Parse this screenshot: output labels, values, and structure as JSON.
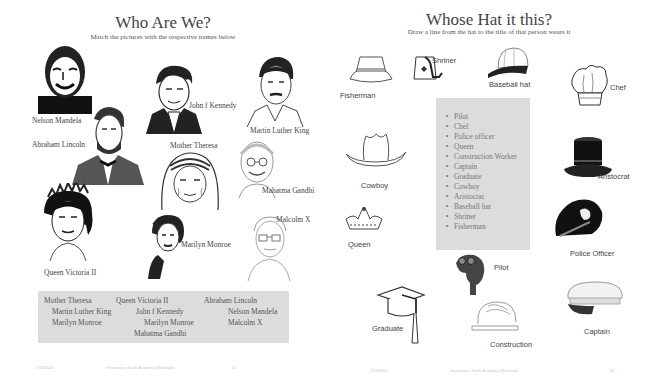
{
  "left_page": {
    "title": "Who Are We?",
    "subtitle": "Match the pictures with the respective names below",
    "portraits": [
      {
        "id": "mandela",
        "label": "Nelson Mandela",
        "icon": "portrait-mandela-icon"
      },
      {
        "id": "jfk",
        "label": "John f Kennedy",
        "icon": "portrait-jfk-icon"
      },
      {
        "id": "mlk",
        "label": "Martin Luther King",
        "icon": "portrait-mlk-icon"
      },
      {
        "id": "lincoln",
        "label": "Abraham Lincoln",
        "icon": "portrait-lincoln-icon"
      },
      {
        "id": "theresa",
        "label": "Mother Theresa",
        "icon": "portrait-theresa-icon"
      },
      {
        "id": "gandhi",
        "label": "Mahatma Gandhi",
        "icon": "portrait-gandhi-icon"
      },
      {
        "id": "queen",
        "label": "Queen Victoria II",
        "icon": "portrait-queen-icon"
      },
      {
        "id": "monroe",
        "label": "Marilyn Monroe",
        "icon": "portrait-monroe-icon"
      },
      {
        "id": "malcolm",
        "label": "Malcolm X",
        "icon": "portrait-malcolm-icon"
      }
    ],
    "names_box": {
      "rows": [
        [
          "Mother Theresa",
          "Queen Victoria II",
          "Abraham Lincoln"
        ],
        [
          "Martin Luther King",
          "John f Kennedy",
          "Nelson Mandela"
        ],
        [
          "Marilyn Monroe",
          "Marilyn Monroe",
          "Malcolm X"
        ],
        [
          "Mahatma Gandhi"
        ]
      ]
    },
    "footer": {
      "date": "7/14/2020",
      "center": "Innovations Youth Academy Workbook",
      "page": "41"
    }
  },
  "right_page": {
    "title": "Whose Hat it this?",
    "subtitle": "Draw a line from the hat to the title of that person wears it",
    "hats": [
      {
        "id": "fisherman",
        "label": "Fisherman",
        "icon": "bucket-hat-icon"
      },
      {
        "id": "shriner",
        "label": "Shriner",
        "icon": "fez-icon"
      },
      {
        "id": "baseball",
        "label": "Baseball hat",
        "icon": "baseball-cap-icon"
      },
      {
        "id": "chef",
        "label": "Chef",
        "icon": "chef-hat-icon"
      },
      {
        "id": "cowboy",
        "label": "Cowboy",
        "icon": "cowboy-hat-icon"
      },
      {
        "id": "aristocrat",
        "label": "Aristocrat",
        "icon": "top-hat-icon"
      },
      {
        "id": "queen",
        "label": "Queen",
        "icon": "crown-icon"
      },
      {
        "id": "police",
        "label": "Police Officer",
        "icon": "police-cap-icon"
      },
      {
        "id": "pilot",
        "label": "Pilot",
        "icon": "pilot-helmet-icon"
      },
      {
        "id": "graduate",
        "label": "Graduate",
        "icon": "graduation-cap-icon"
      },
      {
        "id": "construction",
        "label": "Construction",
        "icon": "hard-hat-icon"
      },
      {
        "id": "captain",
        "label": "Captain",
        "icon": "captain-hat-icon"
      }
    ],
    "word_list": [
      "Pilot",
      "Chef",
      "Police officer",
      "Queen",
      "Construction Worker",
      "Captain",
      "Graduate",
      "Cowboy",
      "Aristocrat",
      "Baseball hat",
      "Shriner",
      "Fisherman"
    ],
    "footer": {
      "date": "7/14/2020",
      "center": "Innovations Youth Academy Workbook",
      "page": "42"
    }
  },
  "colors": {
    "box_gray": "#dcdcdc",
    "text": "#444444",
    "footer_text": "#c8c8c8"
  }
}
